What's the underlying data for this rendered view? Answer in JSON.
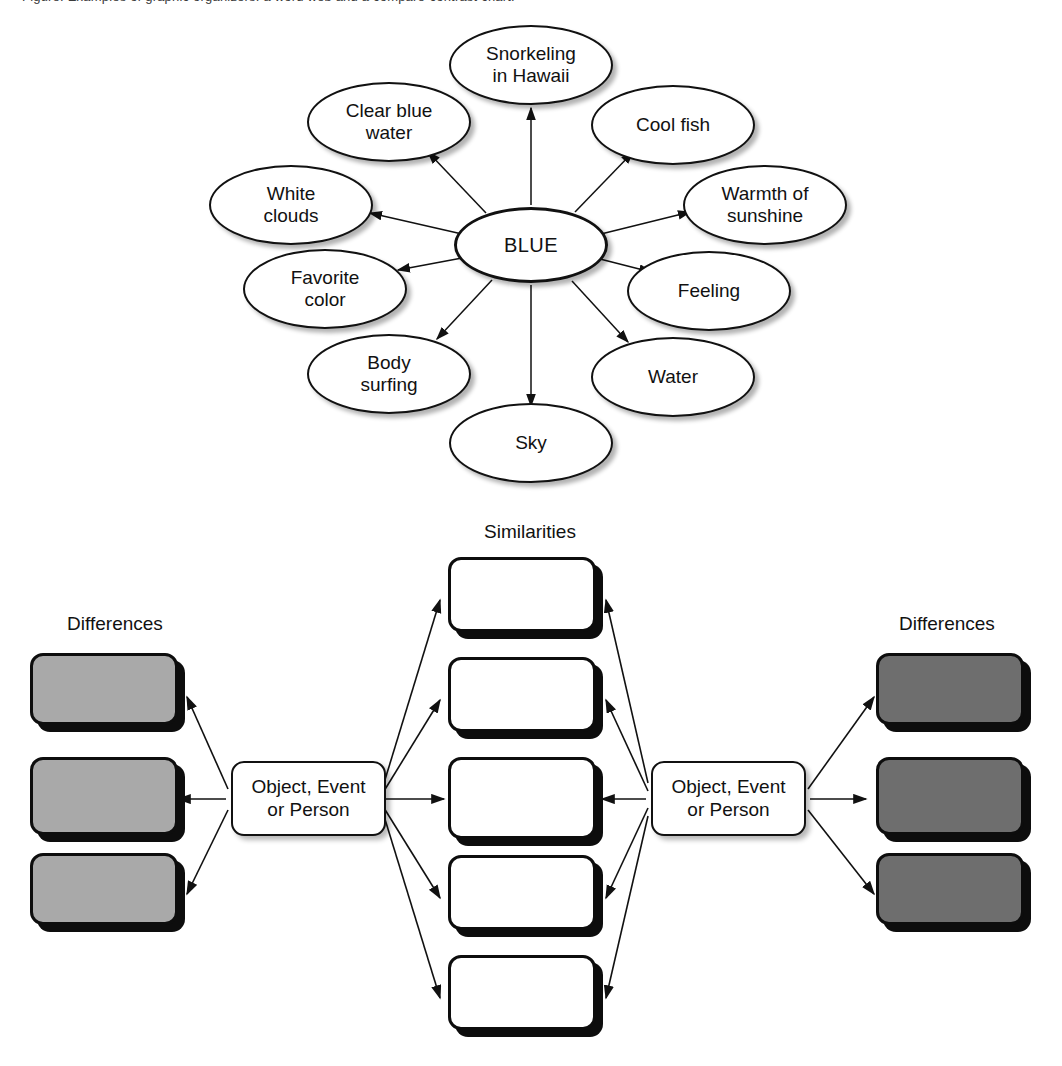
{
  "page": {
    "caption_partial": "Figure. Examples of graphic organizers: a word web and a compare-contrast chart."
  },
  "web_diagram": {
    "center": {
      "label": "BLUE"
    },
    "nodes": [
      {
        "label_line1": "Snorkeling",
        "label_line2": "in Hawaii"
      },
      {
        "label_line1": "Clear blue",
        "label_line2": "water"
      },
      {
        "label_line1": "White",
        "label_line2": "clouds"
      },
      {
        "label_line1": "Favorite",
        "label_line2": "color"
      },
      {
        "label_line1": "Body",
        "label_line2": "surfing"
      },
      {
        "label_line1": "Sky",
        "label_line2": ""
      },
      {
        "label_line1": "Water",
        "label_line2": ""
      },
      {
        "label_line1": "Feeling",
        "label_line2": ""
      },
      {
        "label_line1": "Warmth of",
        "label_line2": "sunshine"
      },
      {
        "label_line1": "Cool fish",
        "label_line2": ""
      }
    ]
  },
  "compare_diagram": {
    "headings": {
      "similarities": "Similarities",
      "differences_left": "Differences",
      "differences_right": "Differences"
    },
    "subject_left": {
      "line1": "Object, Event",
      "line2": "or Person"
    },
    "subject_right": {
      "line1": "Object, Event",
      "line2": "or Person"
    },
    "similarity_boxes": [
      "",
      "",
      "",
      "",
      ""
    ],
    "differences_left_boxes": [
      "",
      "",
      ""
    ],
    "differences_right_boxes": [
      "",
      "",
      ""
    ]
  },
  "colors": {
    "ink": "#111111",
    "shadow_hard": "#0d0d0d",
    "diff_left_fill": "#a9a9a9",
    "diff_right_fill": "#6e6e6e",
    "canvas": "#ffffff"
  }
}
